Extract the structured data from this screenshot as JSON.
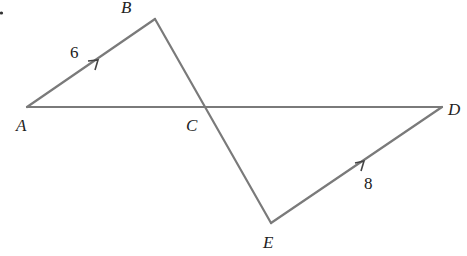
{
  "diagram": {
    "type": "geometry",
    "points": {
      "A": {
        "label": "A",
        "x": 27,
        "y": 107
      },
      "B": {
        "label": "B",
        "x": 155,
        "y": 19
      },
      "C": {
        "label": "C",
        "x": 205,
        "y": 107
      },
      "D": {
        "label": "D",
        "x": 442,
        "y": 107
      },
      "E": {
        "label": "E",
        "x": 271,
        "y": 223
      }
    },
    "segments": [
      {
        "from": "A",
        "to": "B",
        "length_label": "6",
        "parallel_mark": true
      },
      {
        "from": "B",
        "to": "E"
      },
      {
        "from": "A",
        "to": "D"
      },
      {
        "from": "E",
        "to": "D",
        "length_label": "8",
        "parallel_mark": true
      }
    ],
    "labels": {
      "A": "A",
      "B": "B",
      "C": "C",
      "D": "D",
      "E": "E",
      "ab_length": "6",
      "ed_length": "8"
    },
    "colors": {
      "line": "#7a7a7a",
      "text": "#222222"
    }
  }
}
